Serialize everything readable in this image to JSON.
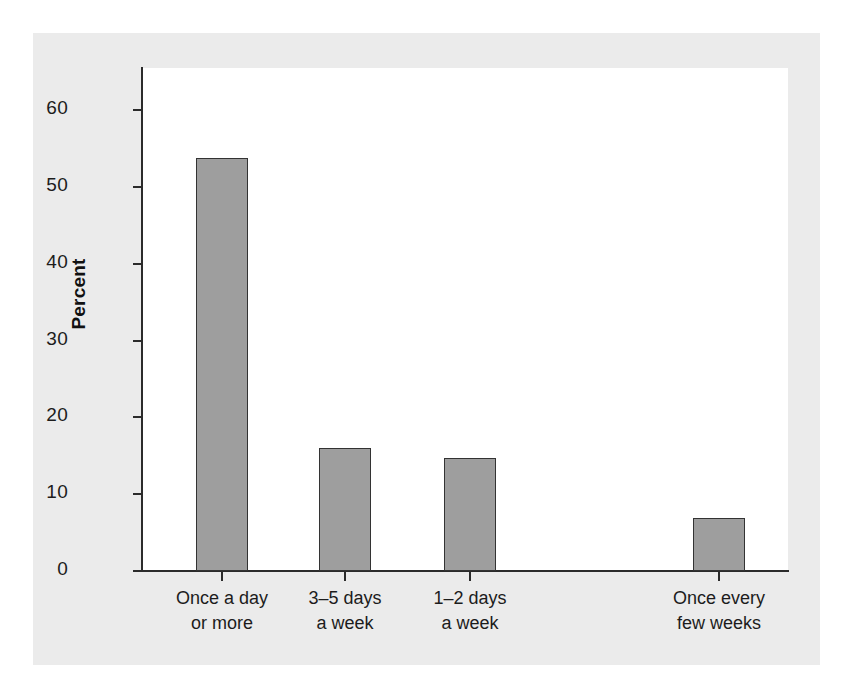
{
  "chart_data": {
    "type": "bar",
    "title": "",
    "xlabel": "",
    "ylabel": "Percent",
    "categories": [
      "Once a day or more",
      "3–5 days a week",
      "1–2 days a week",
      "Once every few weeks"
    ],
    "category_lines": [
      [
        "Once a day",
        "or more"
      ],
      [
        "3–5 days",
        "a week"
      ],
      [
        "1–2 days",
        "a week"
      ],
      [
        "Once every",
        "few weeks"
      ]
    ],
    "values": [
      53.8,
      16.0,
      14.7,
      6.9
    ],
    "ylim": [
      0,
      65
    ],
    "yticks": [
      0,
      10,
      20,
      30,
      40,
      50,
      60
    ],
    "ytick_labels": [
      "0",
      "10",
      "20",
      "30",
      "40",
      "50",
      "60"
    ],
    "grid": false,
    "legend": null,
    "colors": {
      "bar_fill": "#9e9e9e",
      "bar_outline": "#333333",
      "panel_background": "#ebebeb",
      "plot_background": "#ffffff",
      "axis": "#2b2b2b",
      "text": "#1c1c1c"
    }
  }
}
